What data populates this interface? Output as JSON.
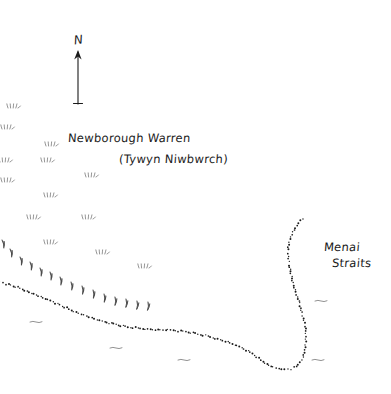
{
  "map": {
    "title_en": "Newborough Warren",
    "title_cy": "(Tywyn Niwbwrch)",
    "water_label_line1": "Menai",
    "water_label_line2": "Straits",
    "north_letter": "N",
    "ink_color": "#1a1a1a",
    "background_color": "#ffffff",
    "compass": {
      "name": "north-arrow",
      "shaft_x": 78,
      "shaft_top_y": 52,
      "shaft_bottom_y": 104,
      "base_tick_half_width": 4
    },
    "coastline": {
      "name": "dotted-coastline",
      "style": "dotted",
      "dot_radius": 0.85,
      "points": [
        [
          0,
          282
        ],
        [
          6,
          284
        ],
        [
          13,
          286
        ],
        [
          20,
          288
        ],
        [
          27,
          291
        ],
        [
          34,
          294
        ],
        [
          41,
          297
        ],
        [
          48,
          300
        ],
        [
          55,
          303
        ],
        [
          62,
          306
        ],
        [
          69,
          309
        ],
        [
          76,
          312
        ],
        [
          84,
          315
        ],
        [
          92,
          318
        ],
        [
          100,
          321
        ],
        [
          109,
          323
        ],
        [
          118,
          325
        ],
        [
          128,
          327
        ],
        [
          138,
          328
        ],
        [
          148,
          329
        ],
        [
          158,
          330
        ],
        [
          168,
          330
        ],
        [
          178,
          331
        ],
        [
          188,
          332
        ],
        [
          198,
          334
        ],
        [
          208,
          336
        ],
        [
          218,
          339
        ],
        [
          228,
          342
        ],
        [
          237,
          346
        ],
        [
          246,
          350
        ],
        [
          254,
          355
        ],
        [
          261,
          360
        ],
        [
          267,
          364
        ],
        [
          273,
          367
        ],
        [
          279,
          369
        ],
        [
          285,
          370
        ],
        [
          291,
          369
        ],
        [
          296,
          366
        ],
        [
          300,
          362
        ],
        [
          303,
          357
        ],
        [
          305,
          350
        ],
        [
          306,
          342
        ],
        [
          306,
          334
        ],
        [
          305,
          326
        ],
        [
          303,
          318
        ],
        [
          301,
          310
        ],
        [
          299,
          301
        ],
        [
          296,
          292
        ],
        [
          293,
          283
        ],
        [
          291,
          274
        ],
        [
          289,
          265
        ],
        [
          288,
          256
        ],
        [
          288,
          247
        ],
        [
          290,
          239
        ],
        [
          293,
          232
        ],
        [
          297,
          226
        ],
        [
          301,
          221
        ],
        [
          305,
          218
        ]
      ]
    },
    "dune_tufts": {
      "name": "dune-grass-tufts",
      "positions": [
        [
          8,
          104
        ],
        [
          2,
          125
        ],
        [
          46,
          142
        ],
        [
          0,
          158
        ],
        [
          42,
          158
        ],
        [
          2,
          178
        ],
        [
          86,
          173
        ],
        [
          45,
          193
        ],
        [
          28,
          215
        ],
        [
          83,
          215
        ],
        [
          45,
          240
        ],
        [
          97,
          250
        ],
        [
          139,
          264
        ]
      ]
    },
    "dune_ridge_hooks": {
      "name": "dune-ridge-hook-marks",
      "positions": [
        [
          2,
          240
        ],
        [
          10,
          249
        ],
        [
          20,
          257
        ],
        [
          30,
          262
        ],
        [
          40,
          268
        ],
        [
          50,
          272
        ],
        [
          60,
          277
        ],
        [
          71,
          282
        ],
        [
          82,
          286
        ],
        [
          93,
          290
        ],
        [
          104,
          294
        ],
        [
          115,
          297
        ],
        [
          126,
          299
        ],
        [
          137,
          301
        ],
        [
          148,
          302
        ]
      ]
    },
    "water_marks": {
      "name": "water-ripple-marks",
      "positions": [
        [
          30,
          322
        ],
        [
          110,
          348
        ],
        [
          178,
          360
        ],
        [
          315,
          301
        ],
        [
          312,
          360
        ]
      ]
    }
  }
}
